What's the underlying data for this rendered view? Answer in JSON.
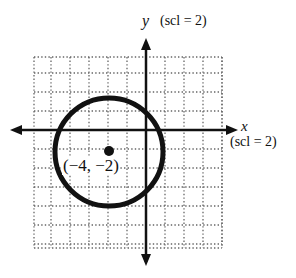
{
  "chart_data": {
    "type": "scatter",
    "title": "",
    "xlabel": "x",
    "ylabel": "y",
    "x_scale_label": "(scl = 2)",
    "y_scale_label": "(scl = 2)",
    "xlim": [
      -12,
      8
    ],
    "ylim": [
      -12,
      8
    ],
    "grid": true,
    "grid_style": "dotted",
    "grid_step": 2,
    "shapes": [
      {
        "kind": "circle",
        "center": [
          -4,
          -2
        ],
        "radius": 5.7
      }
    ],
    "points": [
      {
        "x": -4,
        "y": -2,
        "label": "(−4, −2)"
      }
    ]
  },
  "labels": {
    "y_axis": "y",
    "y_scl": "(scl = 2)",
    "x_axis": "x",
    "x_scl": "(scl = 2)",
    "center_point": "(−4, −2)"
  },
  "colors": {
    "ink": "#111111",
    "grid": "#666666",
    "background": "#ffffff"
  }
}
